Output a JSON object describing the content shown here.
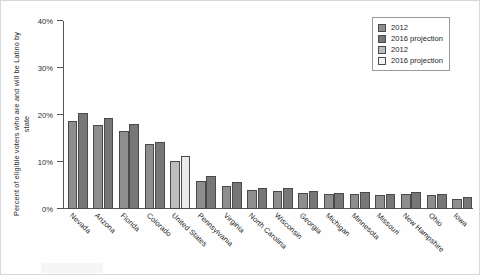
{
  "chart_data": {
    "type": "bar",
    "title": "",
    "xlabel": "",
    "ylabel": "Percent of eligible voters who are and will be Latino by state",
    "ylim": [
      0,
      40
    ],
    "ytick_labels": [
      "0%",
      "10%",
      "20%",
      "30%",
      "40%"
    ],
    "ytick_values": [
      0,
      10,
      20,
      30,
      40
    ],
    "grid": false,
    "legend_position": "top-right",
    "categories": [
      "Nevada",
      "Arizona",
      "Florida",
      "Colorado",
      "United States",
      "Pennsylvania",
      "Virginia",
      "North Carolina",
      "Wisconsin",
      "Georgia",
      "Michigan",
      "Minnesota",
      "Missouri",
      "New Hampshire",
      "Ohio",
      "Iowa"
    ],
    "series": [
      {
        "name": "2012",
        "color": "#8e8e8e",
        "values": [
          18.7,
          17.8,
          16.6,
          13.8,
          null,
          6.0,
          5.0,
          4.1,
          3.9,
          3.4,
          3.1,
          3.2,
          2.9,
          3.1,
          2.9,
          2.2
        ]
      },
      {
        "name": "2016 projection",
        "color": "#777777",
        "values": [
          20.4,
          19.3,
          18.1,
          14.3,
          null,
          7.1,
          5.7,
          4.5,
          4.4,
          3.9,
          3.5,
          3.7,
          3.3,
          3.6,
          3.3,
          2.6
        ]
      },
      {
        "name": "2012",
        "color": "#bdbdbd",
        "values": [
          null,
          null,
          null,
          null,
          10.2,
          null,
          null,
          null,
          null,
          null,
          null,
          null,
          null,
          null,
          null,
          null
        ]
      },
      {
        "name": "2016 projection",
        "color": "#e9e9e9",
        "values": [
          null,
          null,
          null,
          null,
          11.2,
          null,
          null,
          null,
          null,
          null,
          null,
          null,
          null,
          null,
          null,
          null
        ]
      }
    ]
  },
  "legend": {
    "items": [
      {
        "label": "2012"
      },
      {
        "label": "2016 projection"
      },
      {
        "label": "2012"
      },
      {
        "label": "2016 projection"
      }
    ]
  }
}
